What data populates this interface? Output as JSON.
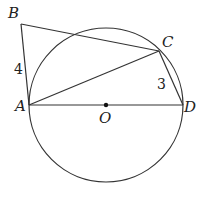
{
  "diagram": {
    "type": "geometry",
    "circle": {
      "center_label": "O",
      "cx": 106,
      "cy": 105,
      "r": 77
    },
    "points": {
      "A": {
        "label": "A",
        "x": 29,
        "y": 105,
        "lx": 15,
        "ly": 111
      },
      "B": {
        "label": "B",
        "x": 21,
        "y": 24,
        "lx": 8,
        "ly": 18
      },
      "C": {
        "label": "C",
        "x": 159,
        "y": 51,
        "lx": 162,
        "ly": 47
      },
      "D": {
        "label": "D",
        "x": 183,
        "y": 105,
        "lx": 184,
        "ly": 112
      },
      "O": {
        "label": "O",
        "x": 106,
        "y": 105,
        "lx": 99,
        "ly": 123
      }
    },
    "segments": [
      {
        "from": "A",
        "to": "B",
        "length_label": "4"
      },
      {
        "from": "B",
        "to": "C"
      },
      {
        "from": "A",
        "to": "C"
      },
      {
        "from": "C",
        "to": "D",
        "length_label": "3"
      },
      {
        "from": "A",
        "to": "D"
      }
    ],
    "length_labels": {
      "AB": {
        "text": "4",
        "x": 14,
        "y": 74
      },
      "CD": {
        "text": "3",
        "x": 157,
        "y": 89
      }
    }
  }
}
